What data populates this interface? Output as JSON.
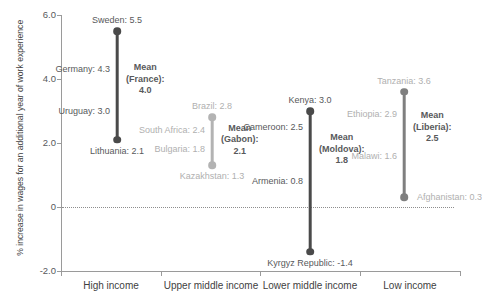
{
  "chart_data": {
    "type": "scatter",
    "title": "",
    "xlabel": "",
    "ylabel": "% increase in wages for an additional year of work experience",
    "ylim": [
      -2.0,
      6.0
    ],
    "y_ticks": [
      "6.0",
      "4.0",
      "2.0",
      "0",
      "-2.0"
    ],
    "y_tick_values": [
      6.0,
      4.0,
      2.0,
      0,
      -2.0
    ],
    "grid": false,
    "legend": "none",
    "zero_reference_line": 0,
    "categories": [
      "High income",
      "Upper middle income",
      "Lower middle income",
      "Low income"
    ],
    "groups": [
      {
        "category": "High income",
        "max_label": "Sweden: 5.5",
        "max_country": "Sweden",
        "max_value": 5.5,
        "min_label": "Lithuania: 2.1",
        "min_country": "Lithuania",
        "min_value": 2.1,
        "mean_label_line1": "Mean",
        "mean_label_line2": "(France):",
        "mean_label_line3": "4.0",
        "mean_country": "France",
        "mean_value": 4.0,
        "points": [
          {
            "label": "Germany: 4.3",
            "country": "Germany",
            "value": 4.3
          },
          {
            "label": "Uruguay: 3.0",
            "country": "Uruguay",
            "value": 3.0
          }
        ]
      },
      {
        "category": "Upper middle income",
        "max_label": "Brazil: 2.8",
        "max_country": "Brazil",
        "max_value": 2.8,
        "min_label": "Kazakhstan: 1.3",
        "min_country": "Kazakhstan",
        "min_value": 1.3,
        "mean_label_line1": "Mean",
        "mean_label_line2": "(Gabon):",
        "mean_label_line3": "2.1",
        "mean_country": "Gabon",
        "mean_value": 2.1,
        "points": [
          {
            "label": "South Africa: 2.4",
            "country": "South Africa",
            "value": 2.4
          },
          {
            "label": "Bulgaria: 1.8",
            "country": "Bulgaria",
            "value": 1.8
          }
        ]
      },
      {
        "category": "Lower middle income",
        "max_label": "Kenya: 3.0",
        "max_country": "Kenya",
        "max_value": 3.0,
        "min_label": "Kyrgyz Republic: -1.4",
        "min_country": "Kyrgyz Republic",
        "min_value": -1.4,
        "mean_label_line1": "Mean",
        "mean_label_line2": "(Moldova):",
        "mean_label_line3": "1.8",
        "mean_country": "Moldova",
        "mean_value": 1.8,
        "points": [
          {
            "label": "Cameroon: 2.5",
            "country": "Cameroon",
            "value": 2.5
          },
          {
            "label": "Armenia: 0.8",
            "country": "Armenia",
            "value": 0.8
          }
        ]
      },
      {
        "category": "Low income",
        "max_label": "Tanzania: 3.6",
        "max_country": "Tanzania",
        "max_value": 3.6,
        "min_label": "Afghanistan: 0.3",
        "min_country": "Afghanistan",
        "min_value": 0.3,
        "mean_label_line1": "Mean",
        "mean_label_line2": "(Liberia):",
        "mean_label_line3": "2.5",
        "mean_country": "Liberia",
        "mean_value": 2.5,
        "points": [
          {
            "label": "Ethiopia: 2.9",
            "country": "Ethiopia",
            "value": 2.9
          },
          {
            "label": "Malawi: 1.6",
            "country": "Malawi",
            "value": 1.6
          }
        ]
      }
    ],
    "colors": {
      "series_dark": "#4a4a4a",
      "series_medium": "#7f7f7f",
      "series_light": "#b3b3b3",
      "label_dark": "#58595b",
      "label_light": "#b0b0b0",
      "axis": "#9a9a9a",
      "background": "#ffffff"
    }
  }
}
